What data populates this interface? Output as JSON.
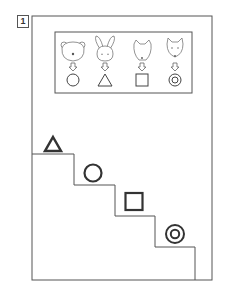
{
  "problem": {
    "number": "1"
  },
  "key": {
    "items": [
      {
        "animal": "bear",
        "shape": "circle"
      },
      {
        "animal": "rabbit",
        "shape": "triangle"
      },
      {
        "animal": "dog",
        "shape": "square"
      },
      {
        "animal": "cat",
        "shape": "double-circle"
      }
    ]
  },
  "stairs": {
    "steps": [
      {
        "index": 1,
        "shape": "triangle"
      },
      {
        "index": 2,
        "shape": "circle"
      },
      {
        "index": 3,
        "shape": "square"
      },
      {
        "index": 4,
        "shape": "double-circle"
      }
    ]
  },
  "colors": {
    "line": "#555555",
    "shape_stroke": "#333333",
    "background": "#ffffff"
  }
}
